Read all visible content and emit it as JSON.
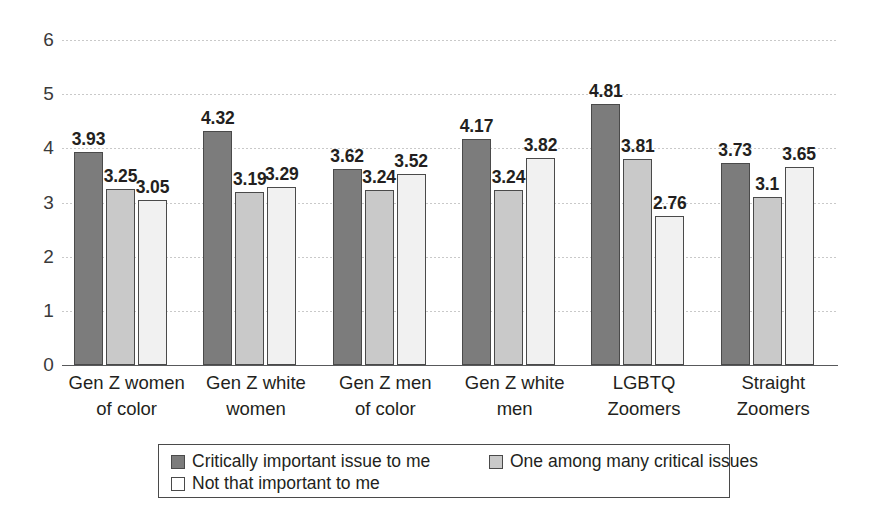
{
  "chart_data": {
    "type": "bar",
    "title": "",
    "subtitle": "",
    "xlabel": "",
    "ylabel": "",
    "ylim": [
      0,
      6
    ],
    "yticks": [
      0,
      1,
      2,
      3,
      4,
      5,
      6
    ],
    "ytick_labels": [
      "0",
      "1",
      "2",
      "3",
      "4",
      "5",
      "6"
    ],
    "grid": true,
    "legend_position": "bottom",
    "categories": [
      "Gen Z women of color",
      "Gen Z white women",
      "Gen Z men of color",
      "Gen Z white men",
      "LGBTQ Zoomers",
      "Straight Zoomers"
    ],
    "category_lines": [
      [
        "Gen Z women",
        "of color"
      ],
      [
        "Gen Z white",
        "women"
      ],
      [
        "Gen Z men",
        "of color"
      ],
      [
        "Gen Z white",
        "men"
      ],
      [
        "LGBTQ",
        "Zoomers"
      ],
      [
        "Straight",
        "Zoomers"
      ]
    ],
    "series": [
      {
        "name": "Critically important issue to me",
        "color": "#7c7c7c",
        "values": [
          3.93,
          4.32,
          3.62,
          4.17,
          4.81,
          3.73
        ],
        "labels": [
          "3.93",
          "4.32",
          "3.62",
          "4.17",
          "4.81",
          "3.73"
        ]
      },
      {
        "name": "One among many critical issues",
        "color": "#c9c9c9",
        "values": [
          3.25,
          3.19,
          3.24,
          3.24,
          3.81,
          3.1
        ],
        "labels": [
          "3.25",
          "3.19",
          "3.24",
          "3.24",
          "3.81",
          "3.1"
        ]
      },
      {
        "name": "Not that important to me",
        "color": "#f1f1f1",
        "values": [
          3.05,
          3.29,
          3.52,
          3.82,
          2.76,
          3.65
        ],
        "labels": [
          "3.05",
          "3.29",
          "3.52",
          "3.82",
          "2.76",
          "3.65"
        ]
      }
    ],
    "legend": [
      {
        "label": "Critically important issue to me",
        "swatch": "s0"
      },
      {
        "label": "One among many critical issues",
        "swatch": "s1"
      },
      {
        "label": "Not that important to me",
        "swatch": "s2"
      }
    ],
    "legend_layout_order": [
      0,
      2,
      1
    ]
  }
}
